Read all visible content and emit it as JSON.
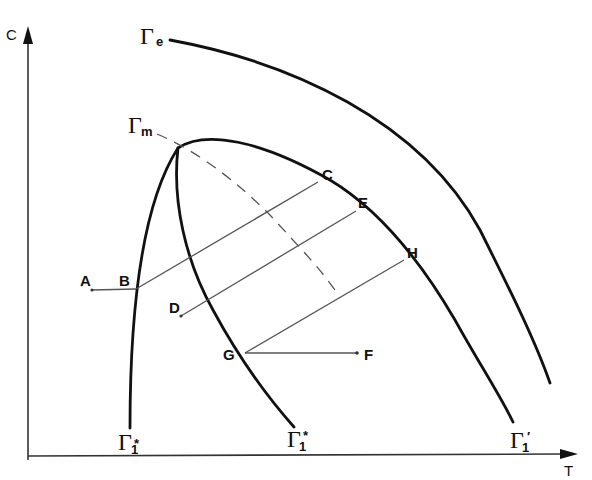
{
  "diagram": {
    "axes": {
      "y_label": "C",
      "x_label": "T"
    },
    "curves": {
      "gamma_e": {
        "symbol": "Γ",
        "subscript": "e"
      },
      "gamma_m": {
        "symbol": "Γ",
        "subscript": "m"
      },
      "gamma_1_star_left": {
        "symbol": "Γ",
        "subscript": "1",
        "star": "*"
      },
      "gamma_1_star_right": {
        "symbol": "Γ",
        "subscript": "1",
        "star": "*"
      },
      "gamma_1_prime": {
        "symbol": "Γ",
        "subscript": "1",
        "prime": "′"
      }
    },
    "points": {
      "A": "A",
      "B": "B",
      "C": "C",
      "D": "D",
      "E": "E",
      "F": "F",
      "G": "G",
      "H": "H"
    }
  },
  "colors": {
    "curve": "#111111",
    "tie_line": "#555555",
    "background": "#ffffff"
  }
}
